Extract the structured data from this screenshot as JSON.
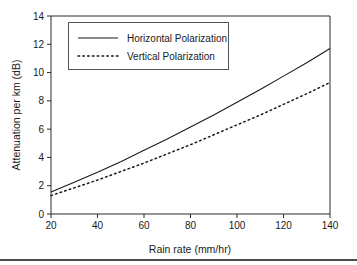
{
  "figure": {
    "name": "rain-attenuation-chart"
  },
  "chart_data": {
    "type": "line",
    "title": "",
    "xlabel": "Rain rate (mm/hr)",
    "ylabel": "Attenuation per km (dB)",
    "xlim": [
      20,
      140
    ],
    "ylim": [
      0,
      14
    ],
    "xticks": [
      20,
      40,
      60,
      80,
      100,
      120,
      140
    ],
    "yticks": [
      0,
      2,
      4,
      6,
      8,
      10,
      12,
      14
    ],
    "xtick_labels": [
      "20",
      "40",
      "60",
      "80",
      "100",
      "120",
      "140"
    ],
    "ytick_labels": [
      "0",
      "2",
      "4",
      "6",
      "8",
      "10",
      "12",
      "14"
    ],
    "grid": false,
    "legend_position": "upper-left-inside",
    "x": [
      20,
      30,
      40,
      50,
      60,
      70,
      80,
      90,
      100,
      110,
      120,
      130,
      140
    ],
    "series": [
      {
        "name": "Horizontal Polarization",
        "style": "solid",
        "color": "#1a1a1a",
        "values": [
          1.55,
          2.25,
          2.95,
          3.7,
          4.5,
          5.3,
          6.15,
          7.0,
          7.9,
          8.8,
          9.75,
          10.7,
          11.7
        ]
      },
      {
        "name": "Vertical Polarization",
        "style": "dotted",
        "color": "#1a1a1a",
        "values": [
          1.3,
          1.85,
          2.4,
          3.0,
          3.6,
          4.25,
          4.9,
          5.6,
          6.3,
          7.0,
          7.75,
          8.5,
          9.3
        ]
      }
    ]
  },
  "legend": {
    "items": [
      {
        "label": "Horizontal Polarization",
        "style": "solid"
      },
      {
        "label": "Vertical Polarization",
        "style": "dotted"
      }
    ]
  }
}
